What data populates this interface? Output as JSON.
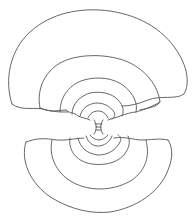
{
  "diagram": {
    "stroke_color": "#555555",
    "background": "#ffffff",
    "upper_lobe_count": 6,
    "lower_lobe_count": 5
  }
}
